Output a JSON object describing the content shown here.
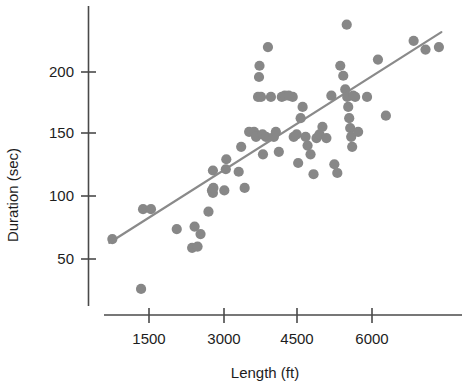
{
  "chart_data": {
    "type": "scatter",
    "title": "",
    "xlabel": "Length (ft)",
    "ylabel": "Duration (sec)",
    "xlim": [
      700,
      7500
    ],
    "ylim": [
      15,
      245
    ],
    "xticks": [
      1500,
      3000,
      4500,
      6000
    ],
    "yticks": [
      50,
      100,
      150,
      200
    ],
    "xtick_labels": [
      "1500",
      "3000",
      "4500",
      "6000"
    ],
    "ytick_labels": [
      "50",
      "100",
      "150",
      "200"
    ],
    "grid": false,
    "legend": null,
    "point_color": "#878787",
    "line_color": "#8a8a8a",
    "axis_color": "#4a4a4a",
    "series": [
      {
        "name": "observations",
        "x": [
          760,
          1380,
          1540,
          1340,
          2060,
          2370,
          2480,
          2700,
          2420,
          2540,
          2770,
          2790,
          2800,
          2790,
          3050,
          3060,
          3020,
          3310,
          3360,
          3430,
          3520,
          3620,
          3660,
          3700,
          3720,
          3730,
          3760,
          3790,
          3800,
          3860,
          3900,
          3960,
          4020,
          4060,
          4120,
          4180,
          4240,
          4320,
          4400,
          4420,
          4480,
          4510,
          4560,
          4600,
          4660,
          4700,
          4760,
          4820,
          4880,
          4940,
          5000,
          5080,
          5180,
          5240,
          5300,
          5360,
          5420,
          5460,
          5490,
          5500,
          5520,
          5540,
          5560,
          5580,
          5600,
          5620,
          5660,
          5720,
          5900,
          6120,
          6280,
          6840,
          7080,
          7350
        ],
        "y": [
          66,
          90,
          90,
          26,
          74,
          59,
          60,
          88,
          76,
          70,
          105,
          103,
          107,
          121,
          122,
          130,
          105,
          120,
          140,
          107,
          152,
          152,
          148,
          180,
          196,
          205,
          180,
          150,
          134,
          148,
          220,
          180,
          148,
          152,
          136,
          180,
          181,
          181,
          180,
          148,
          150,
          127,
          163,
          172,
          148,
          141,
          134,
          118,
          147,
          150,
          156,
          147,
          181,
          126,
          119,
          205,
          197,
          186,
          238,
          180,
          172,
          163,
          155,
          148,
          140,
          181,
          180,
          152,
          180,
          210,
          165,
          225,
          218,
          220
        ]
      }
    ],
    "fit_line": {
      "name": "least-squares fit",
      "x": [
        700,
        7400
      ],
      "y": [
        63,
        232
      ]
    }
  }
}
